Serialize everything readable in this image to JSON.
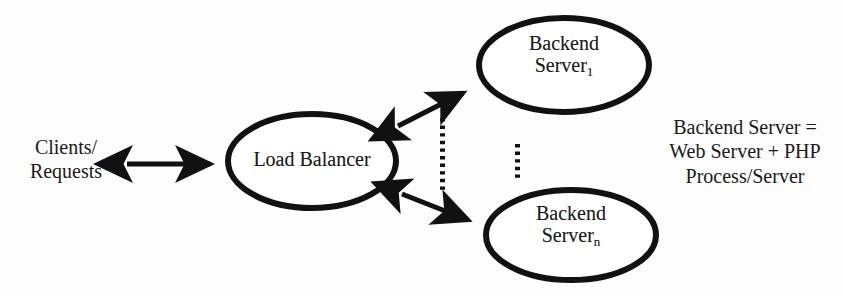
{
  "diagram": {
    "background_color": "#fdfdfd",
    "stroke_color": "#111111",
    "text_color": "#1a1a1a",
    "nodes": {
      "clients": {
        "line1": "Clients/",
        "line2": "Requests"
      },
      "load_balancer": {
        "label": "Load Balancer"
      },
      "backend_top": {
        "line1": "Backend",
        "line2_base": "Server",
        "line2_subscript": "1"
      },
      "backend_bottom": {
        "line1": "Backend",
        "line2_base": "Server",
        "line2_subscript": "n"
      }
    },
    "legend": {
      "line1": "Backend Server =",
      "line2": "Web Server + PHP",
      "line3": "Process/Server"
    },
    "connectors": {
      "clients_to_load_balancer": "bidirectional-arrow",
      "load_balancer_to_backend_top": "bidirectional-arrow",
      "load_balancer_to_backend_bottom": "bidirectional-arrow",
      "ellipsis_left": "vertical-dotted-ellipsis",
      "ellipsis_right": "vertical-dotted-ellipsis"
    }
  }
}
